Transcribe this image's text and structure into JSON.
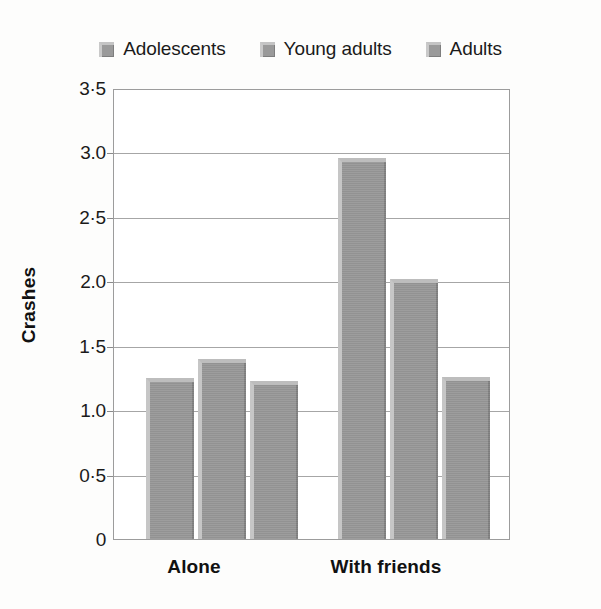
{
  "chart_data": {
    "type": "bar",
    "title": "",
    "xlabel": "",
    "ylabel": "Crashes",
    "categories": [
      "Alone",
      "With friends"
    ],
    "series": [
      {
        "name": "Adolescents",
        "values": [
          1.25,
          2.96
        ]
      },
      {
        "name": "Young adults",
        "values": [
          1.4,
          2.02
        ]
      },
      {
        "name": "Adults",
        "values": [
          1.23,
          1.26
        ]
      }
    ],
    "ylim": [
      0,
      3.5
    ],
    "ytick_values": [
      0,
      0.5,
      1.0,
      1.5,
      2.0,
      2.5,
      3.0,
      3.5
    ],
    "ytick_labels": [
      "0",
      "0·5",
      "1.0",
      "1·5",
      "2.0",
      "2·5",
      "3.0",
      "3·5"
    ],
    "grid": true,
    "legend_position": "top-center",
    "bar_color": "#989898"
  },
  "legend": {
    "items": [
      {
        "label": "Adolescents",
        "swatch": "legend-swatch-icon",
        "color": "#9a9a9a"
      },
      {
        "label": "Young adults",
        "swatch": "legend-swatch-icon",
        "color": "#959595"
      },
      {
        "label": "Adults",
        "swatch": "legend-swatch-icon",
        "color": "#9c9c9c"
      }
    ]
  },
  "axes": {
    "y_title": "Crashes",
    "y_labels": {
      "t0": "0",
      "t1": "0·5",
      "t2": "1.0",
      "t3": "1·5",
      "t4": "2.0",
      "t5": "2·5",
      "t6": "3.0",
      "t7": "3·5"
    },
    "x_labels": {
      "g0": "Alone",
      "g1": "With friends"
    }
  }
}
